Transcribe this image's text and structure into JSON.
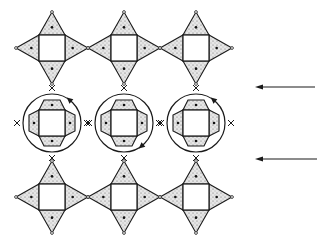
{
  "diagram": {
    "type": "polyhedral-framework-rotation",
    "colors": {
      "line": "#1a1a1a",
      "fill": "#e4e4e4",
      "background": "#ffffff",
      "dot": "#111111"
    },
    "columns_x": [
      52,
      124,
      196
    ],
    "rows": [
      {
        "id": "top",
        "kind": "star",
        "y": 48
      },
      {
        "id": "middle",
        "kind": "rotated-circle",
        "y": 123
      },
      {
        "id": "bottom",
        "kind": "star",
        "y": 197
      }
    ],
    "unit": {
      "square_half": 13,
      "tip_extent": 36,
      "circle_radius": 29
    },
    "rotation_arrows": [
      {
        "column": 0,
        "position": "upper-right"
      },
      {
        "column": 1,
        "position": "lower-right"
      },
      {
        "column": 2,
        "position": "upper-right"
      }
    ],
    "side_arrows": [
      {
        "x1": 315,
        "x2": 255,
        "y": 87,
        "direction": "left"
      },
      {
        "x1": 317,
        "x2": 255,
        "y": 159,
        "direction": "left"
      }
    ]
  }
}
